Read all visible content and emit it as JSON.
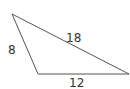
{
  "diagram": {
    "type": "triangle",
    "stroke_color": "#555555",
    "vertices": {
      "top_left": [
        12,
        14
      ],
      "bottom_left": [
        38,
        74
      ],
      "bottom_right": [
        129,
        74
      ]
    },
    "sides": [
      {
        "name": "left",
        "label": "8"
      },
      {
        "name": "hypotenuse",
        "label": "18"
      },
      {
        "name": "base",
        "label": "12"
      }
    ]
  }
}
